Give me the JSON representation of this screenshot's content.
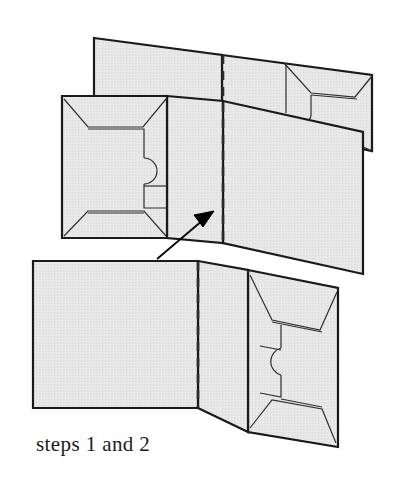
{
  "figure": {
    "title": "steps 1 and 2",
    "caption": "steps 1 and 2",
    "colors": {
      "paper_fill": "#e4e4e4",
      "paper_fill_light": "#ececec",
      "outline": "#1a1a1a",
      "crease_line": "#3a3a3a",
      "detail_line": "#2e2e2e",
      "background": "#ffffff",
      "text": "#1a1a1a",
      "arrow": "#000000"
    },
    "line_widths": {
      "outline": "2.2",
      "detail": "1.2",
      "dashed_crease": "2.6"
    },
    "dash_pattern": "9 7"
  },
  "upper_assembly": {
    "label": "step-2-folded-card-upper",
    "panels": [
      {
        "name": "upper-back-left-panel",
        "description": "back left panel of card, sloping top edge",
        "points": "94,38 222,55 222,117 94,101"
      },
      {
        "name": "upper-back-right-panel",
        "description": "back right panel with envelope flap detail",
        "points": "222,55 372,75 372,151 222,117"
      },
      {
        "name": "upper-front-left-panel",
        "description": "front left panel with envelope pocket detail",
        "points": "62,96 167,96 167,238 62,238"
      },
      {
        "name": "upper-front-mid-panel",
        "description": "front middle panel, blank",
        "points": "167,96 223,101 223,243 167,238"
      },
      {
        "name": "upper-front-right-panel",
        "description": "large front right panel, blank",
        "points": "223,101 363,132 363,274 223,243"
      }
    ]
  },
  "lower_assembly": {
    "label": "step-1-opened-card-lower",
    "panels": [
      {
        "name": "lower-left-panel",
        "description": "large blank left panel, rectangular",
        "points": "33,261 198,261 198,408 33,408"
      },
      {
        "name": "lower-mid-panel",
        "description": "middle panel between crease and envelope panel",
        "points": "198,261 248,270 248,432 198,408"
      },
      {
        "name": "lower-right-panel",
        "description": "right panel with envelope pocket detail",
        "points": "248,270 338,288 338,447 248,432"
      }
    ]
  },
  "creases": [
    {
      "name": "upper-crease-dashed",
      "description": "vertical dashed fold line in upper assembly",
      "from": "223,55",
      "to": "223,243"
    },
    {
      "name": "lower-crease-dashed",
      "description": "vertical dashed fold line in lower assembly",
      "from": "198,262",
      "to": "198,407"
    }
  ],
  "arrow": {
    "name": "fold-direction-arrow",
    "description": "arrow indicating the folding motion from step 1 to step 2",
    "tail": "157,259",
    "head": "214,211"
  },
  "envelope_details": [
    {
      "name": "envelope-detail-upper-left",
      "location": "upper-front-left-panel"
    },
    {
      "name": "envelope-detail-upper-right",
      "location": "upper-back-right-panel"
    },
    {
      "name": "envelope-detail-lower-right",
      "location": "lower-right-panel"
    }
  ]
}
